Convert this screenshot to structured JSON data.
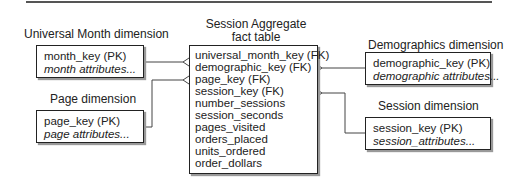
{
  "fact_table": {
    "title_line1": "Session Aggregate",
    "title_line2": "fact table",
    "fields": [
      "universal_month_key (FK)",
      "demographic_key (FK)",
      "page_key (FK)",
      "session_key (FK)",
      "number_sessions",
      "session_seconds",
      "pages_visited",
      "orders_placed",
      "units_ordered",
      "order_dollars"
    ]
  },
  "dimensions": {
    "month": {
      "title": "Universal Month dimension",
      "key": "month_key (PK)",
      "attributes": "month attributes..."
    },
    "page": {
      "title": "Page dimension",
      "key": "page_key (PK)",
      "attributes": "page attributes..."
    },
    "demographics": {
      "title": "Demographics dimension",
      "key": "demographic_key (PK)",
      "attributes": "demographic attributes..."
    },
    "session": {
      "title": "Session dimension",
      "key": "session_key (PK)",
      "attributes": "session_attributes..."
    }
  }
}
